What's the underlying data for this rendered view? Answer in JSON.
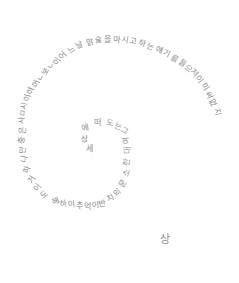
{
  "artwork": {
    "description": "Handwritten Korean text arranged in a spiral",
    "ink_color": "#8a8a8a",
    "background": "#ffffff",
    "glyphs": [
      {
        "t": "이",
        "x": 58,
        "y": 62,
        "r": -55
      },
      {
        "t": "어",
        "x": 64,
        "y": 56,
        "r": -45
      },
      {
        "t": "느",
        "x": 72,
        "y": 50,
        "r": -35
      },
      {
        "t": "날",
        "x": 80,
        "y": 46,
        "r": -25
      },
      {
        "t": "맑",
        "x": 90,
        "y": 43,
        "r": -15
      },
      {
        "t": "술",
        "x": 99,
        "y": 41,
        "r": -8
      },
      {
        "t": "을",
        "x": 108,
        "y": 40,
        "r": 0
      },
      {
        "t": "마",
        "x": 117,
        "y": 40,
        "r": 5
      },
      {
        "t": "시",
        "x": 125,
        "y": 41,
        "r": 8
      },
      {
        "t": "고",
        "x": 133,
        "y": 42,
        "r": 10
      },
      {
        "t": "하",
        "x": 142,
        "y": 44,
        "r": 14
      },
      {
        "t": "는",
        "x": 150,
        "y": 47,
        "r": 18
      },
      {
        "t": "얘",
        "x": 159,
        "y": 50,
        "r": 22
      },
      {
        "t": "기",
        "x": 167,
        "y": 54,
        "r": 28
      },
      {
        "t": "를",
        "x": 175,
        "y": 59,
        "r": 32
      },
      {
        "t": "들",
        "x": 182,
        "y": 64,
        "r": 38
      },
      {
        "t": "으",
        "x": 188,
        "y": 69,
        "r": 42
      },
      {
        "t": "저",
        "x": 194,
        "y": 73,
        "r": 46
      },
      {
        "t": "이",
        "x": 199,
        "y": 80,
        "r": 52
      },
      {
        "t": "미",
        "x": 205,
        "y": 87,
        "r": 58
      },
      {
        "t": "써",
        "x": 209,
        "y": 95,
        "r": 64
      },
      {
        "t": "없",
        "x": 213,
        "y": 103,
        "r": 70
      },
      {
        "t": "지",
        "x": 217,
        "y": 112,
        "r": 76
      },
      {
        "t": "ㄴ",
        "x": 52,
        "y": 66,
        "r": -60
      },
      {
        "t": "보",
        "x": 46,
        "y": 72,
        "r": -62
      },
      {
        "t": "ㄴ",
        "x": 41,
        "y": 78,
        "r": -64
      },
      {
        "t": "어",
        "x": 37,
        "y": 84,
        "r": -68
      },
      {
        "t": "야",
        "x": 32,
        "y": 91,
        "r": -72
      },
      {
        "t": "이",
        "x": 28,
        "y": 98,
        "r": -76
      },
      {
        "t": "시",
        "x": 25,
        "y": 106,
        "r": -80
      },
      {
        "t": "ㅁ",
        "x": 24,
        "y": 113,
        "r": -84
      },
      {
        "t": "사",
        "x": 23,
        "y": 120,
        "r": -88
      },
      {
        "t": "은",
        "x": 23,
        "y": 130,
        "r": -90
      },
      {
        "t": "충",
        "x": 23,
        "y": 140,
        "r": -88
      },
      {
        "t": "만",
        "x": 24,
        "y": 150,
        "r": -84
      },
      {
        "t": "나",
        "x": 25,
        "y": 159,
        "r": -78
      },
      {
        "t": "하",
        "x": 28,
        "y": 170,
        "r": -70
      },
      {
        "t": "거",
        "x": 33,
        "y": 180,
        "r": -60
      },
      {
        "t": "이",
        "x": 38,
        "y": 188,
        "r": -50
      },
      {
        "t": "도",
        "x": 45,
        "y": 195,
        "r": -40
      },
      {
        "t": "해",
        "x": 56,
        "y": 202,
        "r": -20
      },
      {
        "t": "하",
        "x": 64,
        "y": 204,
        "r": -10
      },
      {
        "t": "이",
        "x": 72,
        "y": 205,
        "r": -5
      },
      {
        "t": "추",
        "x": 80,
        "y": 206,
        "r": 0
      },
      {
        "t": "억",
        "x": 88,
        "y": 207,
        "r": 0
      },
      {
        "t": "이",
        "x": 96,
        "y": 206,
        "r": -5
      },
      {
        "t": "반",
        "x": 103,
        "y": 204,
        "r": -10
      },
      {
        "t": "치",
        "x": 111,
        "y": 199,
        "r": -25
      },
      {
        "t": "의",
        "x": 118,
        "y": 193,
        "r": -40
      },
      {
        "t": "문",
        "x": 124,
        "y": 184,
        "r": -60
      },
      {
        "t": "소",
        "x": 127,
        "y": 173,
        "r": -75
      },
      {
        "t": "한",
        "x": 128,
        "y": 162,
        "r": -85
      },
      {
        "t": "대",
        "x": 128,
        "y": 150,
        "r": -90
      },
      {
        "t": "여",
        "x": 127,
        "y": 141,
        "r": -95
      },
      {
        "t": "그",
        "x": 125,
        "y": 131,
        "r": 30
      },
      {
        "t": "는",
        "x": 118,
        "y": 127,
        "r": 15
      },
      {
        "t": "도",
        "x": 110,
        "y": 124,
        "r": 8
      },
      {
        "t": "떠",
        "x": 98,
        "y": 123,
        "r": 0
      },
      {
        "t": "에",
        "x": 86,
        "y": 128,
        "r": -10
      },
      {
        "t": "상",
        "x": 85,
        "y": 140,
        "r": -5
      },
      {
        "t": "세",
        "x": 90,
        "y": 149,
        "r": 0
      },
      {
        "t": "상",
        "x": 164,
        "y": 238,
        "r": 0,
        "big": true
      }
    ]
  }
}
